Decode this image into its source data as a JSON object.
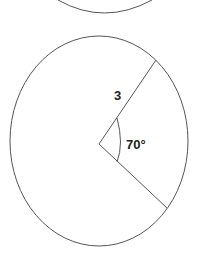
{
  "diagram": {
    "type": "circle-sector",
    "top_partial_circle": {
      "visible": true
    },
    "main_circle": {
      "radius_label": "3",
      "angle_label": "70°",
      "central_angle_degrees": 70
    },
    "colors": {
      "stroke": "#555555",
      "text": "#222222",
      "background": "#ffffff"
    }
  }
}
